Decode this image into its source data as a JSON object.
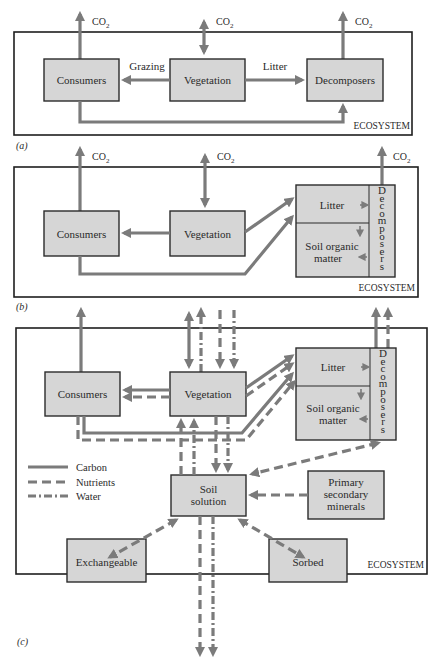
{
  "figure": {
    "panels": [
      {
        "id": "a",
        "caption": "(a)",
        "frame_label": "ECOSYSTEM",
        "co2_label": "CO",
        "co2_sub": "2",
        "boxes": {
          "consumers": "Consumers",
          "vegetation": "Vegetation",
          "decomposers": "Decomposers"
        },
        "flow_labels": {
          "grazing": "Grazing",
          "litter": "Litter"
        }
      },
      {
        "id": "b",
        "caption": "(b)",
        "frame_label": "ECOSYSTEM",
        "co2_label": "CO",
        "co2_sub": "2",
        "boxes": {
          "consumers": "Consumers",
          "vegetation": "Vegetation",
          "litter": "Litter",
          "soil_organic_1": "Soil organic",
          "soil_organic_2": "matter",
          "decomposers_vertical": "Decomposers"
        }
      },
      {
        "id": "c",
        "caption": "(c)",
        "frame_label": "ECOSYSTEM",
        "boxes": {
          "consumers": "Consumers",
          "vegetation": "Vegetation",
          "litter": "Litter",
          "soil_organic_1": "Soil organic",
          "soil_organic_2": "matter",
          "decomposers_vertical": "Decomposers",
          "soil_solution_1": "Soil",
          "soil_solution_2": "solution",
          "minerals_1": "Primary",
          "minerals_2": "secondary",
          "minerals_3": "minerals",
          "exchangeable": "Exchangeable",
          "sorbed": "Sorbed"
        },
        "legend": [
          {
            "key": "carbon",
            "label": "Carbon",
            "style": "solid"
          },
          {
            "key": "nutrients",
            "label": "Nutrients",
            "style": "dashed"
          },
          {
            "key": "water",
            "label": "Water",
            "style": "dash-dot"
          }
        ]
      }
    ],
    "colors": {
      "box_fill": "#d6d6d6",
      "arrow": "#7b7b7b",
      "frame": "#1e1e1e"
    }
  }
}
